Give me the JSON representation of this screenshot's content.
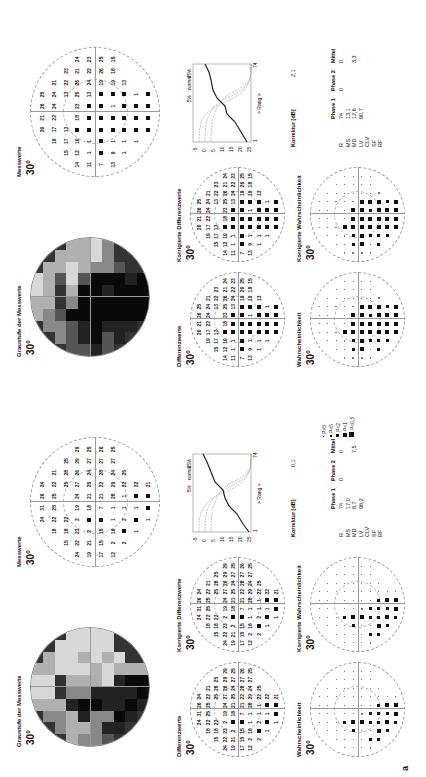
{
  "page_label": "a",
  "legend": {
    "items": [
      {
        "label": "P>5",
        "size": 1
      },
      {
        "label": "P<5",
        "size": 2
      },
      {
        "label": "P<2",
        "size": 3
      },
      {
        "label": "P<1",
        "size": 4
      },
      {
        "label": "P<0,5",
        "size": 5
      }
    ]
  },
  "left": {
    "greyscale_title": "Graustufe der Messwerte",
    "greyscale_deg": "30°",
    "measured_title": "Messwerte",
    "measured_deg": "30°",
    "measured_values": [
      [
        "",
        "",
        "",
        "24",
        "31",
        "26",
        "24",
        "",
        "",
        ""
      ],
      [
        "",
        "",
        "18",
        "22",
        "25",
        "25",
        "22",
        "21",
        "",
        ""
      ],
      [
        "",
        "15",
        "18",
        "22",
        "",
        "",
        "25",
        "28",
        "25",
        ""
      ],
      [
        "24",
        "22",
        "23",
        "2",
        "19",
        "24",
        "27",
        "26",
        "29",
        "29"
      ],
      [
        "19",
        "21",
        "2",
        "■",
        "18",
        "21",
        "25",
        "24",
        "27",
        "25"
      ],
      [
        "17",
        "15",
        "15",
        "■",
        "7",
        "21",
        "22",
        "28",
        "27",
        "26"
      ],
      [
        "12",
        "2",
        "16",
        "1",
        "1",
        "28",
        "29",
        "24",
        "27",
        "25"
      ],
      [
        "",
        "2",
        "■",
        "2",
        "1",
        "1",
        "22",
        "25",
        "",
        ""
      ],
      [
        "",
        "",
        "1",
        "■",
        "1",
        "■",
        "22",
        "",
        "",
        ""
      ],
      [
        "",
        "",
        "",
        "1",
        "■",
        "■",
        "21",
        "",
        "",
        ""
      ]
    ],
    "diff_title": "Differenzwerte",
    "diff_deg": "30°",
    "corr_diff_title": "Korrigierte Differenzwerte",
    "corr_diff_deg": "30°",
    "prob_title": "Wahrscheinlichkeit",
    "prob_deg": "30°",
    "corr_prob_title": "Korrigierte Wahrscheinlichkeit",
    "corr_prob_deg": "30°",
    "correction_label": "Korrektur [dB]",
    "correction_value": "0,1",
    "stats": {
      "headers": [
        "",
        "Phase 1",
        "Phase 2",
        "Mittel"
      ],
      "rows": [
        {
          "label": "R",
          "p1": "74",
          "p2": "0",
          "mean": "0"
        },
        {
          "label": "MS",
          "p1": "17,0",
          "p2": "",
          "mean": ""
        },
        {
          "label": "MD",
          "p1": "8,7",
          "p2": "",
          "mean": "7,5"
        },
        {
          "label": "LV",
          "p1": "96,2",
          "p2": "",
          "mean": ""
        },
        {
          "label": "CLV",
          "p1": "",
          "p2": "",
          "mean": ""
        },
        {
          "label": "SF",
          "p1": "",
          "p2": "",
          "mean": ""
        },
        {
          "label": "RF",
          "p1": "",
          "p2": "",
          "mean": ""
        }
      ]
    },
    "bebie": {
      "xlabel": "> Rang >",
      "x_ticks": [
        "1",
        "74"
      ],
      "y_ticks": [
        "-5",
        "0",
        "5",
        "10",
        "15",
        "20",
        "25"
      ],
      "y_unit": "[dB]",
      "curve_labels": [
        "5%",
        "normal",
        "95%"
      ]
    }
  },
  "right": {
    "greyscale_title": "Graustufe der Messwerte",
    "greyscale_deg": "30°",
    "measured_title": "Messwerte",
    "measured_deg": "30°",
    "measured_values": [
      [
        "",
        "",
        "",
        "20",
        "21",
        "26",
        "25",
        "",
        "",
        ""
      ],
      [
        "",
        "",
        "19",
        "17",
        "22",
        "24",
        "24",
        "21",
        "",
        ""
      ],
      [
        "",
        "15",
        "17",
        "13",
        "",
        "",
        "13",
        "22",
        "23",
        ""
      ],
      [
        "14",
        "12",
        "10",
        "■",
        "18",
        "23",
        "25",
        "26",
        "21",
        "24"
      ],
      [
        "11",
        "1",
        "1",
        "■",
        "■",
        "■",
        "13",
        "24",
        "22",
        "23"
      ],
      [
        "7",
        "■",
        "■",
        "■",
        "■",
        "■",
        "■",
        "19",
        "26",
        "25"
      ],
      [
        "13",
        "9",
        "1",
        "■",
        "■",
        "1",
        "■",
        "19",
        "18",
        "15"
      ],
      [
        "",
        "1",
        "1",
        "■",
        "■",
        "■",
        "■",
        "13",
        "",
        ""
      ],
      [
        "",
        "",
        "1",
        "■",
        "■",
        "■",
        "1",
        "",
        "",
        ""
      ],
      [
        "",
        "",
        "",
        "■",
        "■",
        "■",
        "■",
        "",
        "",
        ""
      ]
    ],
    "diff_title": "Differenzwerte",
    "diff_deg": "30°",
    "corr_diff_title": "Korrigierte Differenzwerte",
    "corr_diff_deg": "30°",
    "prob_title": "Wahrscheinlichkeit",
    "prob_deg": "30°",
    "corr_prob_title": "Korrigierte Wahrscheinlichkeit",
    "corr_prob_deg": "30°",
    "correction_label": "Korrektur [dB]",
    "correction_value": "2,1",
    "stats": {
      "headers": [
        "",
        "Phase 1",
        "Phase 2",
        "Mittel"
      ],
      "rows": [
        {
          "label": "R",
          "p1": "74",
          "p2": "0",
          "mean": "0"
        },
        {
          "label": "MS",
          "p1": "13,1",
          "p2": "",
          "mean": ""
        },
        {
          "label": "MD",
          "p1": "12,6",
          "p2": "",
          "mean": "3,3"
        },
        {
          "label": "LV",
          "p1": "90,7",
          "p2": "",
          "mean": ""
        },
        {
          "label": "CLV",
          "p1": "",
          "p2": "",
          "mean": ""
        },
        {
          "label": "SF",
          "p1": "",
          "p2": "",
          "mean": ""
        },
        {
          "label": "RF",
          "p1": "",
          "p2": "",
          "mean": ""
        }
      ]
    },
    "bebie": {
      "xlabel": "> Rang >",
      "x_ticks": [
        "1",
        "74"
      ],
      "y_ticks": [
        "-5",
        "0",
        "5",
        "10",
        "15",
        "20",
        "25"
      ],
      "y_unit": "[dB]",
      "curve_labels": [
        "5%",
        "normal",
        "95%"
      ]
    }
  }
}
